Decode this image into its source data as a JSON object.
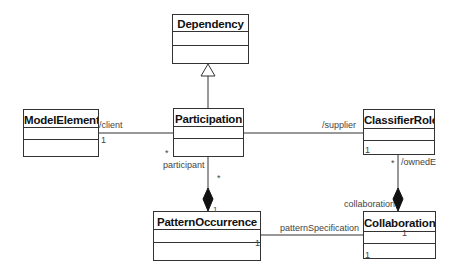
{
  "diagram": {
    "type": "uml-class-diagram",
    "line_color": "#333333",
    "classes": [
      {
        "id": "dependency",
        "name": "Dependency"
      },
      {
        "id": "participation",
        "name": "Participation"
      },
      {
        "id": "model_element",
        "name": "ModelElement"
      },
      {
        "id": "classifier_role",
        "name": "ClassifierRole"
      },
      {
        "id": "pattern_occurrence",
        "name": "PatternOccurrence"
      },
      {
        "id": "collaboration",
        "name": "Collaboration"
      }
    ],
    "relationships": [
      {
        "type": "generalization",
        "from": "Participation",
        "to": "Dependency"
      },
      {
        "type": "association",
        "from": "Participation",
        "to": "ModelElement",
        "role": "/client",
        "multiplicity_far": "1",
        "multiplicity_near": "*",
        "near_role": "participant"
      },
      {
        "type": "association",
        "from": "Participation",
        "to": "ClassifierRole",
        "role": "/supplier",
        "multiplicity": "1"
      },
      {
        "type": "composition",
        "whole": "PatternOccurrence",
        "part": "Participation",
        "multiplicity_part": "*",
        "multiplicity_whole": "1"
      },
      {
        "type": "composition",
        "whole": "Collaboration",
        "part": "ClassifierRole",
        "role": "/ownedE",
        "whole_role": "collaboration",
        "multiplicity_part": "*",
        "multiplicity_whole": "1"
      },
      {
        "type": "association",
        "from": "PatternOccurrence",
        "to": "Collaboration",
        "role": "patternSpecification",
        "multiplicity_near": "1",
        "multiplicity_far": "1"
      }
    ],
    "labels": {
      "client": "/client",
      "client_mult": "1",
      "supplier": "/supplier",
      "supplier_mult": "1",
      "participant": "participant",
      "participant_mult": "*",
      "comp1_mult": "*",
      "comp1_whole_mult": "1",
      "owned": "/ownedE",
      "owned_mult": "*",
      "collaboration_role": "collaboration",
      "pattern_spec": "patternSpecification",
      "ps_mult_left": "1",
      "ps_mult_right": "1",
      "collab_bottom_mult": "1"
    }
  }
}
